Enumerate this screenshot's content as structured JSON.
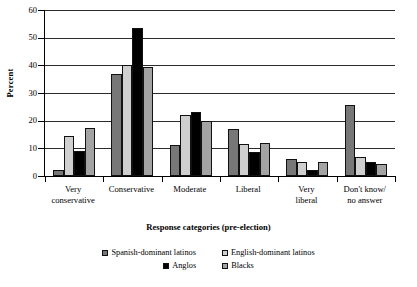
{
  "chart_data": {
    "type": "bar",
    "title": "",
    "xlabel": "Response categories (pre-election)",
    "ylabel": "Percent",
    "ylim": [
      0,
      60
    ],
    "yticks": [
      0,
      10,
      20,
      30,
      40,
      50,
      60
    ],
    "grid": true,
    "legend_position": "bottom",
    "categories": [
      "Very conservative",
      "Conservative",
      "Moderate",
      "Liberal",
      "Very liberal",
      "Don't know/ no answer"
    ],
    "category_lines": [
      [
        "Very",
        "conservative"
      ],
      [
        "Conservative",
        ""
      ],
      [
        "Moderate",
        ""
      ],
      [
        "Liberal",
        ""
      ],
      [
        "Very",
        "liberal"
      ],
      [
        "Don't know/",
        "no answer"
      ]
    ],
    "series": [
      {
        "name": "Spanish-dominant latinos",
        "color": "#777777",
        "values": [
          2,
          36.8,
          11.2,
          17,
          6,
          25.5
        ]
      },
      {
        "name": "English-dominant latinos",
        "color": "#cfcfcf",
        "values": [
          14.3,
          40,
          22,
          11.5,
          5,
          7
        ]
      },
      {
        "name": "Anglos",
        "color": "#000000",
        "values": [
          9,
          53.5,
          23.2,
          8.5,
          2,
          5
        ]
      },
      {
        "name": "Blacks",
        "color": "#a3a3a3",
        "values": [
          17.5,
          39.5,
          20,
          12,
          5,
          4.5
        ]
      }
    ]
  }
}
